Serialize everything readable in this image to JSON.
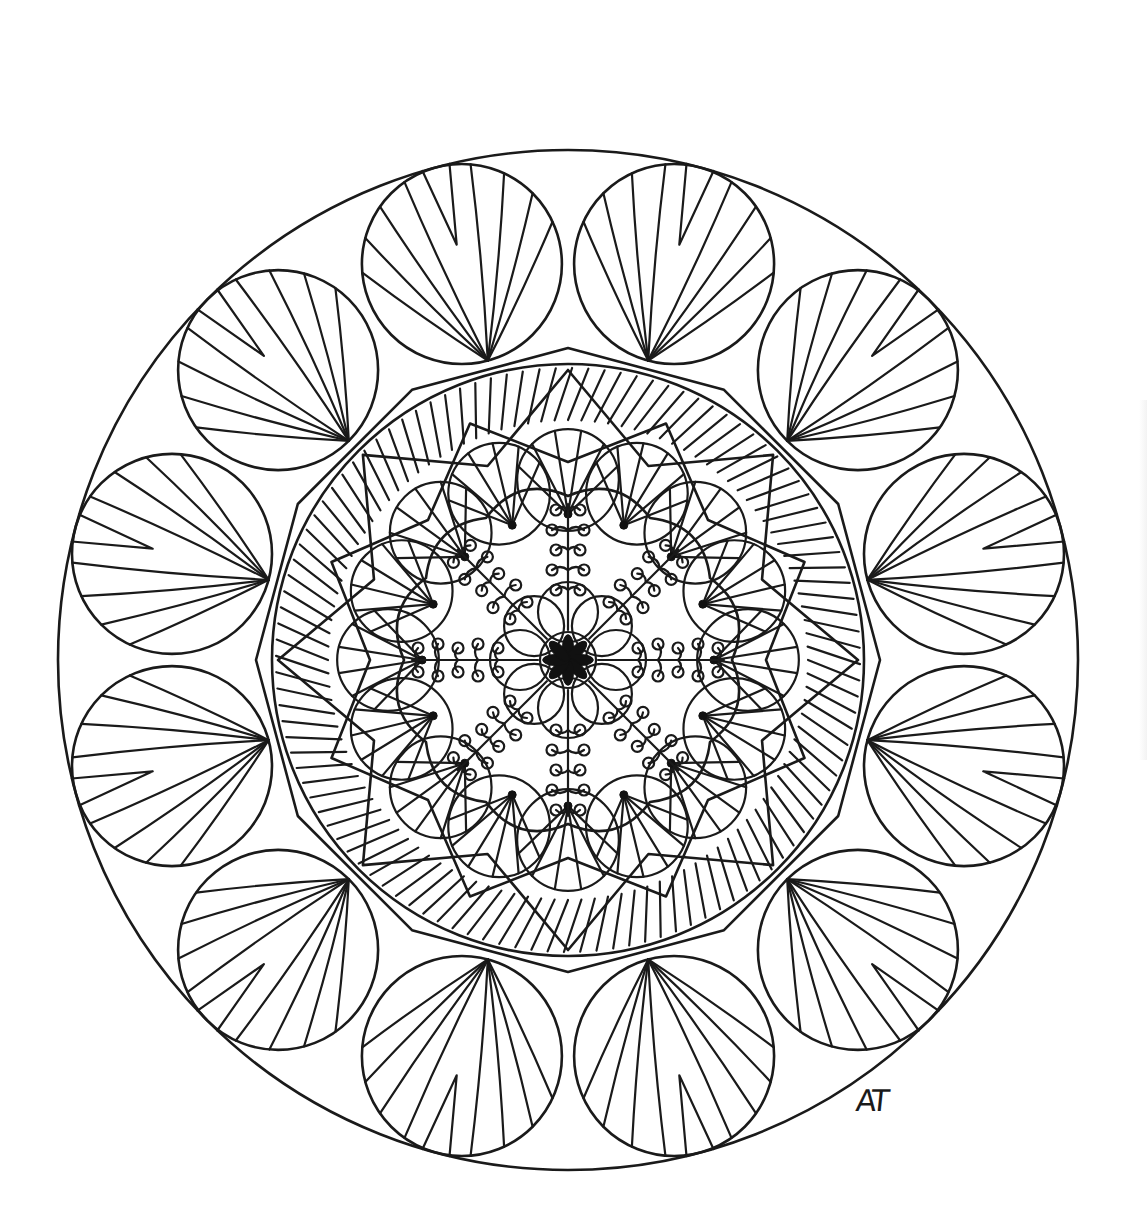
{
  "artwork": {
    "title": "Mandala coloring page",
    "signature": "AT",
    "background": "#ffffff",
    "line_color": "#1a1a1a",
    "center": [
      568,
      660
    ],
    "outer_circle_radius": 510,
    "outer_leaves": {
      "count": 12,
      "ring_radius": 410,
      "leaf_radius": 100,
      "veins": 9,
      "rotation_deg": 15
    },
    "dodecagon": {
      "points": 12,
      "radius": 312
    },
    "inner_circle_radius": 296,
    "hatched_band": {
      "inner_radius": 200,
      "outer_radius": 296
    },
    "star_petals": {
      "count": 8,
      "tip_radius": 296,
      "valley_radius": 210
    },
    "fan_scallops": {
      "count": 16,
      "ring_radius": 200,
      "scallop_radius": 62,
      "ribs": 6
    },
    "lace_medallion": {
      "radius": 178,
      "lobes": 12,
      "spokes": 8,
      "curl_count_per_spoke": 5
    },
    "center_flower": {
      "petals": 8,
      "radius": 22,
      "fill": "#111111"
    }
  }
}
